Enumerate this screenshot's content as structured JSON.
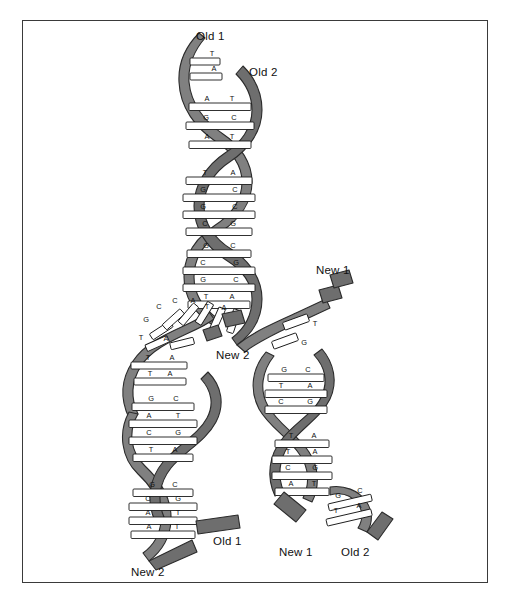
{
  "figure": {
    "type": "semiconservative-replication",
    "colors": {
      "backbone": "#808080",
      "backbone_dark": "#6e6e6e",
      "backbone_edge": "#2b2b2b",
      "rung": "#ffffff",
      "rung_edge": "#1a1a1a",
      "text": "#111111",
      "frame": "#3a3a3a",
      "page": "#ffffff"
    }
  },
  "labels": [
    {
      "id": "old1-top",
      "text": "Old 1",
      "x": 196,
      "y": 30,
      "align": "left"
    },
    {
      "id": "old2-top",
      "text": "Old 2",
      "x": 249,
      "y": 66,
      "align": "left"
    },
    {
      "id": "new1-right",
      "text": "New 1",
      "x": 316,
      "y": 264,
      "align": "left"
    },
    {
      "id": "new2-mid",
      "text": "New 2",
      "x": 216,
      "y": 349,
      "align": "left"
    },
    {
      "id": "old1-bottom",
      "text": "Old 1",
      "x": 213,
      "y": 535,
      "align": "left"
    },
    {
      "id": "new2-bottom",
      "text": "New 2",
      "x": 131,
      "y": 566,
      "align": "left"
    },
    {
      "id": "new1-bottom",
      "text": "New 1",
      "x": 279,
      "y": 546,
      "align": "left"
    },
    {
      "id": "old2-bottom",
      "text": "Old 2",
      "x": 341,
      "y": 546,
      "align": "left"
    }
  ],
  "parent_helix": {
    "name": "parent-duplex",
    "strands": [
      "Old 1",
      "Old 2"
    ],
    "top_unpaired": [
      {
        "base": "T",
        "side": "left"
      },
      {
        "base": "A",
        "side": "left"
      }
    ],
    "base_pairs": [
      {
        "left": "A",
        "right": "T"
      },
      {
        "left": "G",
        "right": "C"
      },
      {
        "left": "A",
        "right": "T"
      },
      {
        "left": "T",
        "right": "A"
      },
      {
        "left": "G",
        "right": "C"
      },
      {
        "left": "G",
        "right": "C"
      },
      {
        "left": "C",
        "right": "G"
      },
      {
        "left": "G",
        "right": "C"
      },
      {
        "left": "C",
        "right": "G"
      },
      {
        "left": "G",
        "right": "C"
      },
      {
        "left": "T",
        "right": "A"
      }
    ]
  },
  "replication_fork": {
    "name": "fork-region",
    "left_template_bases": [
      "T",
      "G",
      "C",
      "A",
      "C",
      "A",
      "T",
      "A"
    ],
    "right_template_bases": [
      "T",
      "G"
    ],
    "free_nucleotides": [
      "T",
      "G"
    ]
  },
  "daughter_left": {
    "name": "daughter-duplex-left",
    "strands": [
      "Old 1",
      "New 2"
    ],
    "base_pairs": [
      {
        "left": "T",
        "right": "A"
      },
      {
        "left": "T",
        "right": "A"
      },
      {
        "left": "G",
        "right": "C"
      },
      {
        "left": "A",
        "right": "T"
      },
      {
        "left": "C",
        "right": "G"
      },
      {
        "left": "T",
        "right": "A"
      },
      {
        "left": "G",
        "right": "C"
      },
      {
        "left": "C",
        "right": "G"
      },
      {
        "left": "A",
        "right": "T"
      },
      {
        "left": "A",
        "right": "T"
      }
    ]
  },
  "daughter_right": {
    "name": "daughter-duplex-right",
    "strands": [
      "New 1",
      "Old 2"
    ],
    "base_pairs": [
      {
        "left": "G",
        "right": "C"
      },
      {
        "left": "T",
        "right": "A"
      },
      {
        "left": "C",
        "right": "G"
      },
      {
        "left": "T",
        "right": "A"
      },
      {
        "left": "T",
        "right": "A"
      },
      {
        "left": "C",
        "right": "G"
      },
      {
        "left": "A",
        "right": "T"
      },
      {
        "left": "C",
        "right": "G"
      },
      {
        "left": "G",
        "right": "C"
      },
      {
        "left": "T",
        "right": "A"
      }
    ]
  }
}
